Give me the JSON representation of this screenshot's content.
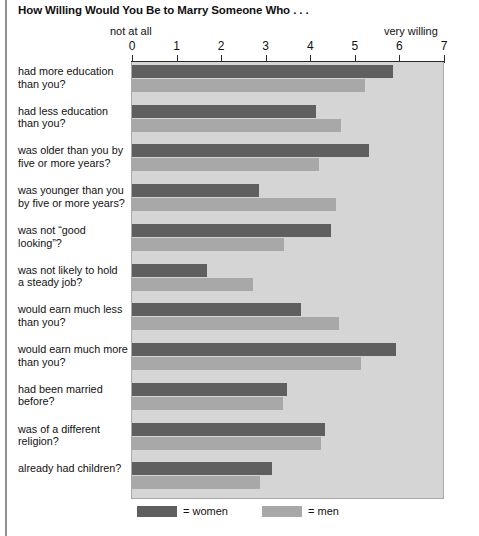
{
  "chart_data": {
    "type": "bar",
    "orientation": "horizontal",
    "title": "How Willing Would You Be to Marry Someone Who . . .",
    "xlabel": "",
    "ylabel": "",
    "xlim": [
      0,
      7
    ],
    "xticks": [
      0,
      1,
      2,
      3,
      4,
      5,
      6,
      7
    ],
    "axis_low_label": "not at all",
    "axis_high_label": "very willing",
    "grid": false,
    "legend_position": "bottom-left",
    "categories": [
      "had more education than you?",
      "had less education than you?",
      "was older than you by five or more years?",
      "was younger than you by five or more years?",
      "was not “good looking”?",
      "was not likely to hold a steady job?",
      "would earn much less than you?",
      "would earn much more than you?",
      "had been married before?",
      "was of a different religion?",
      "already had children?"
    ],
    "series": [
      {
        "name": "women",
        "color": "#5f5f5f",
        "values": [
          5.85,
          4.12,
          5.31,
          2.84,
          4.46,
          1.69,
          3.8,
          5.92,
          3.47,
          4.32,
          3.13
        ]
      },
      {
        "name": "men",
        "color": "#a8a8a8",
        "values": [
          5.22,
          4.7,
          4.19,
          4.57,
          3.42,
          2.72,
          4.64,
          5.13,
          3.38,
          4.25,
          2.88
        ]
      }
    ]
  },
  "category_lines": [
    [
      "had more education",
      "than you?"
    ],
    [
      "had less education",
      "than you?"
    ],
    [
      "was older than you by",
      "five or more years?"
    ],
    [
      "was younger than you",
      "by five or more years?"
    ],
    [
      "was not “good looking”?",
      ""
    ],
    [
      "was not likely to hold",
      "a steady job?"
    ],
    [
      "would earn much less",
      "than you?"
    ],
    [
      "would earn much more",
      "than you?"
    ],
    [
      "had been married",
      "before?"
    ],
    [
      "was of a different",
      "religion?"
    ],
    [
      "already had children?",
      ""
    ]
  ],
  "legend": {
    "women_label": "= women",
    "men_label": "= men"
  },
  "colors": {
    "women": "#5f5f5f",
    "men": "#a8a8a8",
    "plot_background": "#d5d5d5",
    "axis": "#2b2b2b"
  }
}
